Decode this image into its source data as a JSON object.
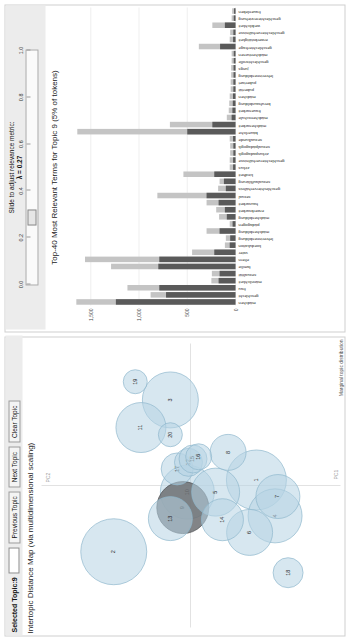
{
  "controls": {
    "selected_topic_label": "Selected Topic:",
    "selected_topic_value": "9",
    "topic_input_value": "",
    "previous_topic": "Previous Topic",
    "next_topic": "Next Topic",
    "clear_topic": "Clear Topic"
  },
  "map": {
    "title": "Intertopic Distance Map (via multidimensional scaling)",
    "x_axis_label": "PC1",
    "y_axis_label": "PC2",
    "legend_label": "Marginal topic distribution"
  },
  "slider": {
    "caption_line1": "Slide to adjust relevance metric:",
    "caption_line2": "λ = 0.27",
    "lambda_value": 0.27,
    "min": 0.0,
    "max": 1.0,
    "ticks": [
      "0.0",
      "0.2",
      "0.4",
      "0.6",
      "0.8",
      "1.0"
    ]
  },
  "barchart_title": "Top-40 Most Relevant Terms for Topic 9 (5% of tokens)",
  "colors": {
    "overall_frequency": "#c4c4c4",
    "estimated_term_frequency": "#5a5a5a",
    "bubble_fill": "#b7d4e4",
    "bubble_selected": "#6c6f72",
    "panel_background": "#ececec"
  },
  "chart_data": [
    {
      "type": "scatter",
      "title": "Intertopic Distance Map (via multidimensional scaling)",
      "xlabel": "PC1",
      "ylabel": "PC2",
      "xlim": [
        -0.25,
        0.25
      ],
      "ylim": [
        -0.25,
        0.25
      ],
      "grid": false,
      "legend": "Marginal topic distribution",
      "selected_topic": 9,
      "points": [
        {
          "topic": 1,
          "x": 0.01,
          "y": -0.112,
          "size": 30
        },
        {
          "topic": 2,
          "x": -0.12,
          "y": 0.14,
          "size": 33
        },
        {
          "topic": 3,
          "x": 0.155,
          "y": 0.04,
          "size": 28
        },
        {
          "topic": 4,
          "x": -0.055,
          "y": -0.145,
          "size": 27
        },
        {
          "topic": 5,
          "x": -0.012,
          "y": -0.04,
          "size": 24
        },
        {
          "topic": 6,
          "x": -0.085,
          "y": -0.1,
          "size": 23
        },
        {
          "topic": 7,
          "x": -0.02,
          "y": -0.15,
          "size": 22
        },
        {
          "topic": 8,
          "x": 0.06,
          "y": -0.062,
          "size": 18
        },
        {
          "topic": 9,
          "x": -0.04,
          "y": 0.018,
          "size": 26
        },
        {
          "topic": 10,
          "x": -0.012,
          "y": 0.01,
          "size": 27
        },
        {
          "topic": 11,
          "x": 0.105,
          "y": 0.092,
          "size": 25
        },
        {
          "topic": 12,
          "x": 0.042,
          "y": 0.008,
          "size": 14
        },
        {
          "topic": 13,
          "x": -0.06,
          "y": 0.04,
          "size": 22
        },
        {
          "topic": 14,
          "x": -0.062,
          "y": -0.052,
          "size": 21
        },
        {
          "topic": 15,
          "x": 0.048,
          "y": 0.0,
          "size": 14
        },
        {
          "topic": 16,
          "x": 0.052,
          "y": -0.01,
          "size": 13
        },
        {
          "topic": 17,
          "x": 0.03,
          "y": 0.028,
          "size": 16
        },
        {
          "topic": 18,
          "x": -0.158,
          "y": -0.168,
          "size": 15
        },
        {
          "topic": 19,
          "x": 0.188,
          "y": 0.102,
          "size": 12
        },
        {
          "topic": 20,
          "x": 0.092,
          "y": 0.04,
          "size": 12
        }
      ]
    },
    {
      "type": "bar",
      "orientation": "vertical",
      "title": "Top-40 Most Relevant Terms for Topic 9 (5% of tokens)",
      "xlabel": "",
      "ylabel": "",
      "ylim": [
        0,
        1700
      ],
      "yticks": [
        0,
        500,
        1000,
        1500
      ],
      "ytick_labels": [
        "0",
        "500",
        "1,000",
        "1,500"
      ],
      "grid": true,
      "series": [
        {
          "name": "Overall term frequency",
          "color": "#c4c4c4"
        },
        {
          "name": "Estimated term frequency within the selected topic",
          "color": "#5a5a5a"
        }
      ],
      "categories": [
        "mädchen",
        "geschlecht",
        "frau",
        "männlichkeit",
        "sexualität",
        "familie",
        "eltern",
        "vater",
        "koedukation",
        "lehrerinnenbildung",
        "mädchenbildung",
        "pädagogen",
        "mädchenbildung",
        "erwerbsarbeit",
        "hausarbeit",
        "sexual",
        "geschlechterverhältnis",
        "sexualaufklärung",
        "kindheit",
        "zirkus",
        "geschlechterverhältnisse",
        "zirkuspadagogik",
        "sexualpädagogik",
        "sexualkunde",
        "bäuerliche",
        "mädchenarbeit",
        "mädchenschule",
        "frauenarbeit",
        "berufsausbildung",
        "mädchen",
        "pubertät",
        "pubertaet",
        "lehrerinnenbildung",
        "jungs",
        "geschlechtsrolle",
        "mädchenturnen",
        "geschlechterfrage",
        "erwerbstätigkeit",
        "geschlechterverhältnisse",
        "weiblichkeit",
        "geschlechtererziehung",
        "frauenleben"
      ],
      "overall_values": [
        1650,
        880,
        1120,
        250,
        245,
        1290,
        1560,
        450,
        110,
        100,
        300,
        60,
        170,
        200,
        300,
        810,
        180,
        165,
        540,
        60,
        60,
        55,
        55,
        60,
        1640,
        680,
        90,
        70,
        65,
        60,
        50,
        50,
        45,
        45,
        40,
        40,
        380,
        60,
        55,
        240,
        40,
        35
      ],
      "estimated_values": [
        1240,
        720,
        790,
        175,
        165,
        800,
        790,
        220,
        60,
        55,
        165,
        30,
        90,
        110,
        175,
        300,
        100,
        120,
        220,
        25,
        25,
        22,
        22,
        25,
        500,
        240,
        40,
        32,
        28,
        26,
        22,
        22,
        20,
        20,
        18,
        18,
        160,
        25,
        22,
        110,
        18,
        15
      ]
    }
  ]
}
